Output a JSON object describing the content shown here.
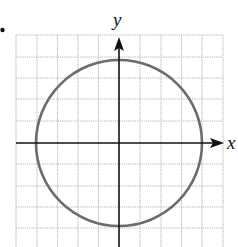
{
  "figure": {
    "bullet": "•",
    "x_axis_label": "x",
    "y_axis_label": "y",
    "grid": {
      "columns": 10,
      "rows_visible": 10,
      "spacing_px": 20.7,
      "line_style": "dotted",
      "line_color": "#b5b5b5"
    },
    "axes_color": "#111111",
    "curve": {
      "type": "circle",
      "equation": "x^2 + y^2 = 16",
      "center": [
        0,
        0
      ],
      "radius": 4,
      "color": "#6b6b6b"
    },
    "visible_range": {
      "x": [
        -5,
        5
      ],
      "y": [
        -5,
        5
      ]
    }
  }
}
